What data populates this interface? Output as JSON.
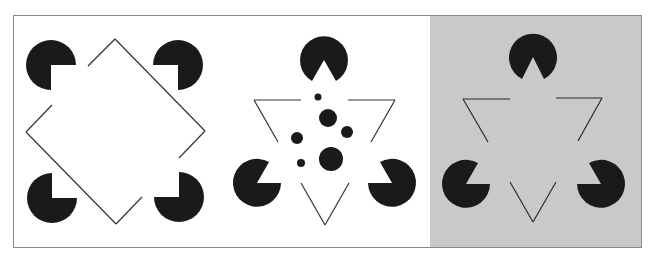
{
  "figure": {
    "colors": {
      "background": "#ffffff",
      "frame": "#8a8a8a",
      "ink": "#1a1a1a",
      "gray_panel": "#c9c9c9"
    },
    "panels": [
      {
        "id": "square",
        "label": "Illusory square with four pac-man inducers and broken diamond outline"
      },
      {
        "id": "triangle-with-dots",
        "label": "Kanizsa triangle with interior dots"
      },
      {
        "id": "triangle-gray",
        "label": "Kanizsa triangle on gray background"
      }
    ]
  }
}
